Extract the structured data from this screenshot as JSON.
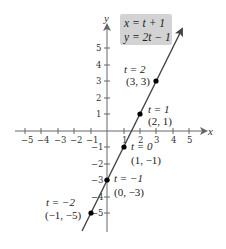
{
  "equations": {
    "line1": "x = t + 1",
    "line2": "y = 2t − 1",
    "box_color": "#d3d3d3"
  },
  "axes": {
    "x_label": "x",
    "y_label": "y",
    "x_ticks": [
      "−5",
      "−4",
      "−3",
      "−2",
      "−1",
      "1",
      "2",
      "3",
      "4",
      "5"
    ],
    "y_ticks": [
      "5",
      "4",
      "3",
      "2",
      "1",
      "−1",
      "−2",
      "−3",
      "−4",
      "−5"
    ],
    "color": "#555555"
  },
  "line": {
    "color": "#444444",
    "description": "Parametric line x = t + 1, y = 2t − 1 (equivalently y = 2x − 3)"
  },
  "points": [
    {
      "t_label": "t = 2",
      "coord_label": "(3, 3)",
      "x": 3,
      "y": 3
    },
    {
      "t_label": "t = 1",
      "coord_label": "(2, 1)",
      "x": 2,
      "y": 1
    },
    {
      "t_label": "t = 0",
      "coord_label": "(1, −1)",
      "x": 1,
      "y": -1
    },
    {
      "t_label": "t = −1",
      "coord_label": "(0, −3)",
      "x": 0,
      "y": -3
    },
    {
      "t_label": "t = −2",
      "coord_label": "(−1, −5)",
      "x": -1,
      "y": -5
    }
  ]
}
